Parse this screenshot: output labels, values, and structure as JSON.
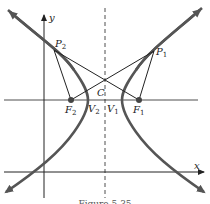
{
  "figure": {
    "type": "hyperbola-focal-diagram",
    "caption": "Figure 5.35",
    "axes": {
      "x_label": "x",
      "y_label": "y"
    },
    "points": {
      "P1": {
        "name": "P",
        "sub": "1"
      },
      "P2": {
        "name": "P",
        "sub": "2"
      },
      "F1": {
        "name": "F",
        "sub": "1"
      },
      "F2": {
        "name": "F",
        "sub": "2"
      },
      "V1": {
        "name": "V",
        "sub": "1"
      },
      "V2": {
        "name": "V",
        "sub": "2"
      },
      "C": {
        "name": "C"
      }
    },
    "colors": {
      "curve": "#555555",
      "lines": "#222222",
      "background": "#ffffff"
    }
  }
}
